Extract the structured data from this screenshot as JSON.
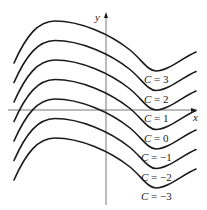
{
  "figure": {
    "axes": {
      "x_label": "x",
      "y_label": "y"
    },
    "curves": [
      {
        "C": "3",
        "label_var": "C",
        "label_eq": " = 3",
        "offset": 0
      },
      {
        "C": "2",
        "label_var": "C",
        "label_eq": " = 2",
        "offset": 19.5
      },
      {
        "C": "1",
        "label_var": "C",
        "label_eq": " = 1",
        "offset": 39
      },
      {
        "C": "0",
        "label_var": "C",
        "label_eq": " = 0",
        "offset": 58.5
      },
      {
        "C": "-1",
        "label_var": "C",
        "label_eq": " = −1",
        "offset": 78
      },
      {
        "C": "-2",
        "label_var": "C",
        "label_eq": " = −2",
        "offset": 97.5
      },
      {
        "C": "-3",
        "label_var": "C",
        "label_eq": " = −3",
        "offset": 117
      }
    ],
    "colors": {
      "curve": "#1a1a1a",
      "axis": "#555555",
      "background": "#ffffff"
    }
  }
}
